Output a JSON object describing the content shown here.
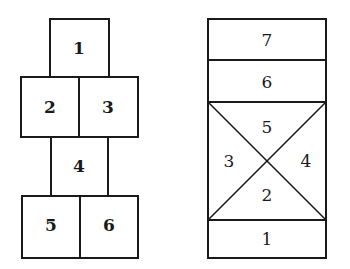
{
  "diagrams": [
    {
      "name": "hopscotch-layout-a",
      "cells": [
        {
          "label": "1",
          "x": 50,
          "y": 19,
          "w": 59,
          "h": 58
        },
        {
          "label": "2",
          "x": 21,
          "y": 77,
          "w": 58,
          "h": 60
        },
        {
          "label": "3",
          "x": 79,
          "y": 77,
          "w": 59,
          "h": 60
        },
        {
          "label": "4",
          "x": 51,
          "y": 137,
          "w": 57,
          "h": 59
        },
        {
          "label": "5",
          "x": 22,
          "y": 196,
          "w": 58,
          "h": 62
        },
        {
          "label": "6",
          "x": 80,
          "y": 196,
          "w": 58,
          "h": 62
        }
      ]
    },
    {
      "name": "hopscotch-layout-b",
      "outer": {
        "x": 208,
        "y": 19,
        "w": 118,
        "h": 239
      },
      "rows": [
        {
          "label": "7",
          "y1": 19,
          "y2": 60
        },
        {
          "label": "6",
          "y1": 60,
          "y2": 102
        },
        {
          "label": "1",
          "y1": 220,
          "y2": 258
        }
      ],
      "cross": {
        "y1": 102,
        "y2": 220
      },
      "triangles": [
        {
          "label": "5",
          "cx": 267,
          "cy": 127
        },
        {
          "label": "3",
          "cx": 229,
          "cy": 161
        },
        {
          "label": "4",
          "cx": 306,
          "cy": 161
        },
        {
          "label": "2",
          "cx": 267,
          "cy": 195
        }
      ]
    }
  ],
  "colors": {
    "stroke": "#1a1a1a",
    "background": "#ffffff"
  }
}
